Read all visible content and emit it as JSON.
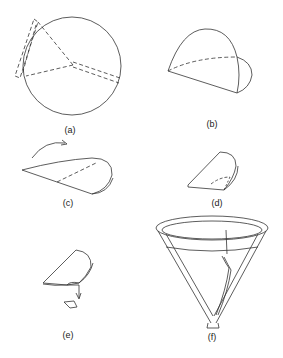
{
  "figure": {
    "panels": [
      {
        "id": "a",
        "label": "(a)",
        "content": "circular filter paper with dashed fold lines and a dashed rectangular flap at upper-left"
      },
      {
        "id": "b",
        "label": "(b)",
        "content": "paper folded in half into a semicircle, with dashed curved fold line"
      },
      {
        "id": "c",
        "label": "(c)",
        "content": "half-circle being folded over with curved arrow and dashed crease"
      },
      {
        "id": "d",
        "label": "(d)",
        "content": "quarter-folded paper with dashed inner crease"
      },
      {
        "id": "e",
        "label": "(e)",
        "content": "corner being torn off, small piece falling with downward arrow"
      },
      {
        "id": "f",
        "label": "(f)",
        "content": "opened filter paper cone seated inside a funnel"
      }
    ]
  },
  "colors": {
    "line": "#333333",
    "background": "#ffffff"
  }
}
